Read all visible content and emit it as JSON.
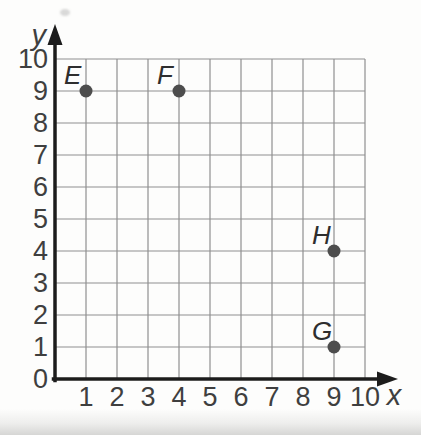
{
  "chart_data": {
    "type": "scatter",
    "xlabel": "x",
    "ylabel": "y",
    "xlim": [
      0,
      10
    ],
    "ylim": [
      0,
      10
    ],
    "grid": true,
    "grid_step": 1,
    "x_ticks": [
      1,
      2,
      3,
      4,
      5,
      6,
      7,
      8,
      9,
      10
    ],
    "y_ticks": [
      0,
      1,
      2,
      3,
      4,
      5,
      6,
      7,
      8,
      9,
      10
    ],
    "points": [
      {
        "label": "E",
        "x": 1,
        "y": 9
      },
      {
        "label": "F",
        "x": 4,
        "y": 9
      },
      {
        "label": "H",
        "x": 9,
        "y": 4
      },
      {
        "label": "G",
        "x": 9,
        "y": 1
      }
    ],
    "legend_position": "none",
    "colors": {
      "point": "#4d4d4d",
      "grid_line": "#8f8f8f",
      "axis": "#1c1c1c",
      "tick_label": "#3f3f3f",
      "point_label": "#2e2e2e"
    }
  }
}
